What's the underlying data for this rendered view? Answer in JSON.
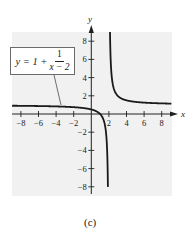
{
  "chart_data": {
    "type": "line",
    "title": "",
    "function_label": {
      "lhs": "y = 1 +",
      "numerator": "1",
      "denominator": "x − 2",
      "full": "y = 1 + 1/(x − 2)"
    },
    "xlabel": "x",
    "ylabel": "y",
    "xlim": [
      -9,
      9.5
    ],
    "ylim": [
      -9,
      9.5
    ],
    "x_ticks": [
      -8,
      -6,
      -4,
      -2,
      2,
      4,
      6,
      8
    ],
    "x_tick_labels": [
      "−8",
      "−6",
      "−4",
      "−2",
      "2",
      "4",
      "6",
      "8"
    ],
    "y_ticks": [
      8,
      6,
      4,
      2,
      -2,
      -4,
      -6,
      -8
    ],
    "y_tick_labels": [
      "8",
      "6",
      "4",
      "2",
      "−2",
      "−4",
      "−6",
      "−8"
    ],
    "grid": false,
    "legend": null,
    "vertical_asymptote": 2,
    "horizontal_asymptote": 1,
    "series": [
      {
        "name": "left branch",
        "x": [
          -8.5,
          -8,
          -6,
          -4,
          -2,
          0,
          1,
          1.5,
          1.8,
          1.9,
          1.94
        ],
        "y": [
          0.905,
          0.9,
          0.875,
          0.833,
          0.75,
          0.5,
          0.0,
          -1.0,
          -4.0,
          -9.0,
          -15.7
        ]
      },
      {
        "name": "right branch",
        "x": [
          2.13,
          2.2,
          2.5,
          3,
          4,
          6,
          8,
          9
        ],
        "y": [
          8.7,
          6.0,
          3.0,
          2.0,
          1.5,
          1.25,
          1.167,
          1.143
        ]
      }
    ],
    "caption": "(c)",
    "colors": {
      "background": "#f1f1f1",
      "curve": "#1a1a1a",
      "axis": "#222222"
    }
  }
}
